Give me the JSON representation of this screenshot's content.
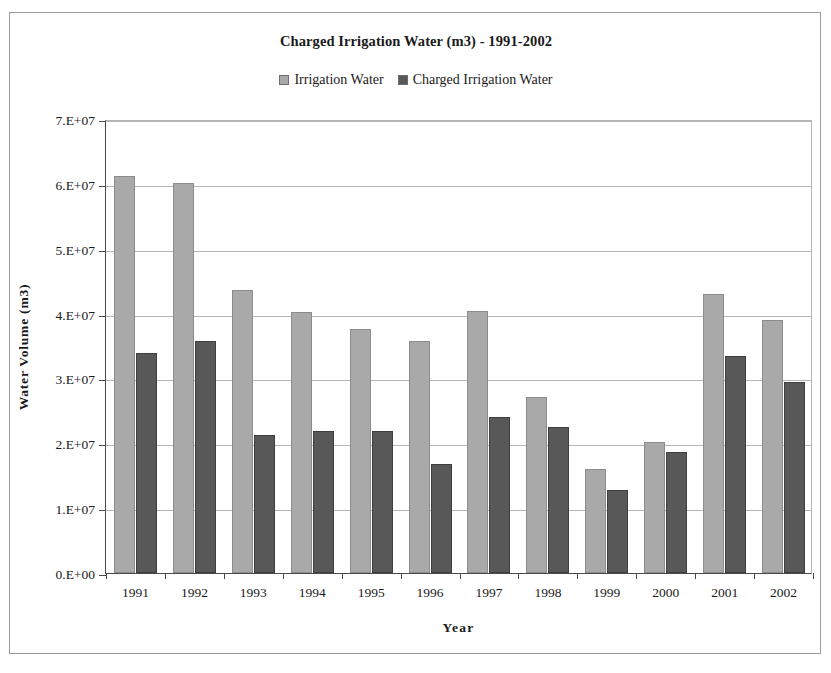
{
  "chart_data": {
    "type": "bar",
    "title": "Charged Irrigation Water (m3) - 1991-2002",
    "xlabel": "Year",
    "ylabel": "Water Volume (m3)",
    "categories": [
      "1991",
      "1992",
      "1993",
      "1994",
      "1995",
      "1996",
      "1997",
      "1998",
      "1999",
      "2000",
      "2001",
      "2002"
    ],
    "series": [
      {
        "name": "Irrigation Water",
        "color": "#a9a9a9",
        "values": [
          61200000,
          60100000,
          43700000,
          40300000,
          37600000,
          35700000,
          40400000,
          27100000,
          16000000,
          20200000,
          43000000,
          39000000
        ]
      },
      {
        "name": "Charged Irrigation Water",
        "color": "#585858",
        "values": [
          34000000,
          35700000,
          21300000,
          21900000,
          21900000,
          16800000,
          24000000,
          22500000,
          12800000,
          18600000,
          33400000,
          29400000
        ]
      }
    ],
    "ylim": [
      0,
      70000000
    ],
    "yticks": [
      0,
      10000000,
      20000000,
      30000000,
      40000000,
      50000000,
      60000000,
      70000000
    ],
    "ytick_labels": [
      "0.E+00",
      "1.E+07",
      "2.E+07",
      "3.E+07",
      "4.E+07",
      "5.E+07",
      "6.E+07",
      "7.E+07"
    ],
    "grid": "horizontal",
    "legend_position": "top-center"
  }
}
